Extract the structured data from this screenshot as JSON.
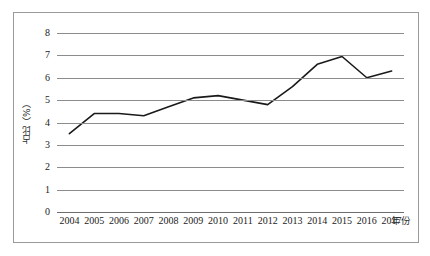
{
  "chart_data": {
    "type": "line",
    "title": "",
    "xlabel": "年份",
    "ylabel": "占比（%）",
    "categories": [
      "2004",
      "2005",
      "2006",
      "2007",
      "2008",
      "2009",
      "2010",
      "2011",
      "2012",
      "2013",
      "2014",
      "2015",
      "2016",
      "2017"
    ],
    "values": [
      3.5,
      4.4,
      4.4,
      4.3,
      4.7,
      5.1,
      5.2,
      5.0,
      4.8,
      5.6,
      6.6,
      6.95,
      6.0,
      6.3
    ],
    "series": [
      {
        "name": "占比（%）",
        "values": [
          3.5,
          4.4,
          4.4,
          4.3,
          4.7,
          5.1,
          5.2,
          5.0,
          4.8,
          5.6,
          6.6,
          6.95,
          6.0,
          6.3
        ]
      }
    ],
    "ylim": [
      0,
      8
    ],
    "ytick_labels": [
      "0",
      "1",
      "2",
      "3",
      "4",
      "5",
      "6",
      "7",
      "8"
    ],
    "ytick_values": [
      0,
      1,
      2,
      3,
      4,
      5,
      6,
      7,
      8
    ],
    "xtick_labels": [
      "2004",
      "2005",
      "2006",
      "2007",
      "2008",
      "2009",
      "2010",
      "2011",
      "2012",
      "2013",
      "2014",
      "2015",
      "2016",
      "2017"
    ],
    "grid": true,
    "grid_axis": "y",
    "legend": false,
    "legend_position": "none",
    "line_color": "#1a1a1a",
    "grid_color": "#8c8c8c",
    "border_color": "#9a9a9a",
    "background_color": "#ffffff",
    "markers": false
  }
}
